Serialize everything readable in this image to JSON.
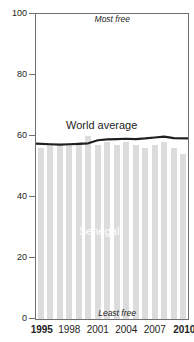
{
  "chart_data": {
    "type": "bar",
    "title": "",
    "xlabel": "",
    "ylabel": "",
    "ylim": [
      0,
      100
    ],
    "xlim": [
      1995,
      2010
    ],
    "grid": false,
    "legend_position": "inline-labels",
    "categories": [
      1995,
      1996,
      1997,
      1998,
      1999,
      2000,
      2001,
      2002,
      2003,
      2004,
      2005,
      2006,
      2007,
      2008,
      2009,
      2010
    ],
    "ytick_labels": [
      "0",
      "20",
      "40",
      "60",
      "80",
      "100"
    ],
    "ytick_values": [
      0,
      20,
      40,
      60,
      80,
      100
    ],
    "xtick_labels": [
      "1995",
      "1998",
      "2001",
      "2004",
      "2007",
      "2010"
    ],
    "xtick_values": [
      1995,
      1998,
      2001,
      2004,
      2007,
      2010
    ],
    "xtick_bold": [
      1995,
      2010
    ],
    "annotations": [
      {
        "text": "Most free",
        "position": "top-right",
        "style": "italic"
      },
      {
        "text": "Least free",
        "position": "bottom-center",
        "style": "italic"
      }
    ],
    "series": [
      {
        "name": "Senegal",
        "render": "bar",
        "color": "#dcdcdc",
        "label_color": "#ffffff",
        "values": [
          56,
          57,
          57,
          57,
          58,
          60,
          57,
          58,
          57,
          58,
          57,
          56,
          57,
          58,
          56,
          54
        ]
      },
      {
        "name": "World average",
        "render": "line",
        "color": "#231f20",
        "values": [
          57.5,
          57.3,
          57.2,
          57.3,
          57.4,
          57.6,
          58.6,
          58.9,
          59.0,
          59.1,
          59.0,
          59.2,
          59.5,
          59.8,
          59.3,
          59.2
        ]
      }
    ]
  },
  "labels": {
    "world_average": "World average",
    "senegal": "Senegal",
    "most_free": "Most free",
    "least_free": "Least free"
  },
  "colors": {
    "bar": "#dcdcdc",
    "line": "#231f20",
    "axis": "#6f6f72",
    "text": "#232323",
    "bar_label": "#ffffff"
  }
}
